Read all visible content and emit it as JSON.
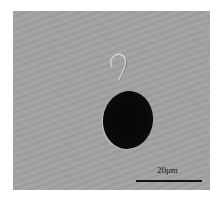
{
  "image": {
    "description": "Micrograph of a dark oval cell with a single curled flagellum on a gray background",
    "scale_bar": {
      "label": "20μm",
      "color": "#111111"
    },
    "colors": {
      "background": "#a0a0a0",
      "cell": "#080808"
    }
  }
}
